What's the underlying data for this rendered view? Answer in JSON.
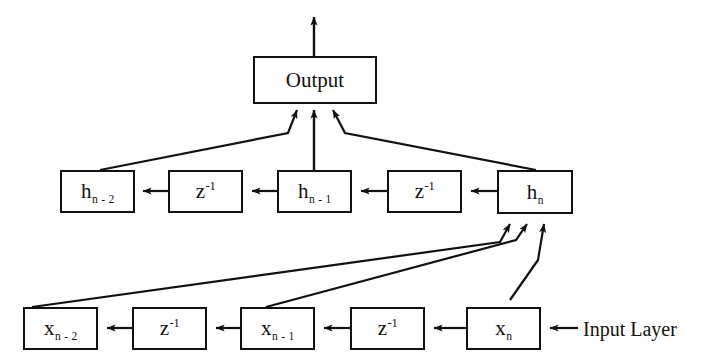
{
  "diagram": {
    "background_color": "#ffffff",
    "stroke_color": "#111111",
    "output_node": {
      "id": "output",
      "label": "Output",
      "x": 253,
      "y": 56,
      "width": 124,
      "height": 48
    },
    "hidden_layer": {
      "name": "hidden-layer",
      "nodes": [
        {
          "id": "h-n-2",
          "base": "h",
          "sub": "n - 2",
          "sup": "",
          "x": 60,
          "y": 170,
          "width": 75,
          "height": 43
        },
        {
          "id": "hidden-delay-1",
          "base": "z",
          "sub": "",
          "sup": "-1",
          "x": 168,
          "y": 170,
          "width": 75,
          "height": 43
        },
        {
          "id": "h-n-1",
          "base": "h",
          "sub": "n - 1",
          "sup": "",
          "x": 277,
          "y": 170,
          "width": 75,
          "height": 43
        },
        {
          "id": "hidden-delay-2",
          "base": "z",
          "sub": "",
          "sup": "-1",
          "x": 387,
          "y": 170,
          "width": 75,
          "height": 43
        },
        {
          "id": "h-n",
          "base": "h",
          "sub": "n",
          "sup": "",
          "x": 497,
          "y": 170,
          "width": 76,
          "height": 44
        }
      ]
    },
    "input_layer": {
      "name": "input-layer",
      "label": "Input Layer",
      "label_x": 583,
      "label_y": 318,
      "nodes": [
        {
          "id": "x-n-2",
          "base": "x",
          "sub": "n - 2",
          "sup": "",
          "x": 23,
          "y": 307,
          "width": 75,
          "height": 43
        },
        {
          "id": "input-delay-1",
          "base": "z",
          "sub": "",
          "sup": "-1",
          "x": 132,
          "y": 307,
          "width": 75,
          "height": 43
        },
        {
          "id": "x-n-1",
          "base": "x",
          "sub": "n - 1",
          "sup": "",
          "x": 240,
          "y": 307,
          "width": 75,
          "height": 43
        },
        {
          "id": "input-delay-2",
          "base": "z",
          "sub": "",
          "sup": "-1",
          "x": 350,
          "y": 307,
          "width": 75,
          "height": 43
        },
        {
          "id": "x-n",
          "base": "x",
          "sub": "n",
          "sup": "",
          "x": 466,
          "y": 307,
          "width": 75,
          "height": 43
        }
      ]
    },
    "edges": [
      {
        "id": "edge-output-up",
        "from": "output",
        "to": "arrow-tip-top",
        "kind": "vertical-arrow"
      },
      {
        "id": "edge-h-n-2-to-output",
        "from": "h-n-2",
        "to": "output",
        "kind": "diagonal-arrow"
      },
      {
        "id": "edge-h-n-1-to-output",
        "from": "h-n-1",
        "to": "output",
        "kind": "vertical-arrow"
      },
      {
        "id": "edge-h-n-to-output",
        "from": "h-n",
        "to": "output",
        "kind": "diagonal-arrow"
      },
      {
        "id": "edge-hidden-delay-1-to-h-n-2",
        "from": "hidden-delay-1",
        "to": "h-n-2",
        "kind": "horizontal-arrow"
      },
      {
        "id": "edge-h-n-1-to-hidden-delay-1",
        "from": "h-n-1",
        "to": "hidden-delay-1",
        "kind": "horizontal-arrow"
      },
      {
        "id": "edge-hidden-delay-2-to-h-n-1",
        "from": "hidden-delay-2",
        "to": "h-n-1",
        "kind": "horizontal-arrow"
      },
      {
        "id": "edge-h-n-to-hidden-delay-2",
        "from": "h-n",
        "to": "hidden-delay-2",
        "kind": "horizontal-arrow"
      },
      {
        "id": "edge-input-delay-1-to-x-n-2",
        "from": "input-delay-1",
        "to": "x-n-2",
        "kind": "horizontal-arrow"
      },
      {
        "id": "edge-x-n-1-to-input-delay-1",
        "from": "x-n-1",
        "to": "input-delay-1",
        "kind": "horizontal-arrow"
      },
      {
        "id": "edge-input-delay-2-to-x-n-1",
        "from": "input-delay-2",
        "to": "x-n-1",
        "kind": "horizontal-arrow"
      },
      {
        "id": "edge-x-n-to-input-delay-2",
        "from": "x-n",
        "to": "input-delay-2",
        "kind": "horizontal-arrow"
      },
      {
        "id": "edge-input-source-to-x-n",
        "from": "input-layer-label",
        "to": "x-n",
        "kind": "horizontal-arrow"
      },
      {
        "id": "edge-x-n-2-to-h-n",
        "from": "x-n-2",
        "to": "h-n",
        "kind": "diagonal-arrow"
      },
      {
        "id": "edge-x-n-1-to-h-n",
        "from": "x-n-1",
        "to": "h-n",
        "kind": "diagonal-arrow"
      },
      {
        "id": "edge-x-n-to-h-n",
        "from": "x-n",
        "to": "h-n",
        "kind": "diagonal-arrow"
      }
    ]
  }
}
